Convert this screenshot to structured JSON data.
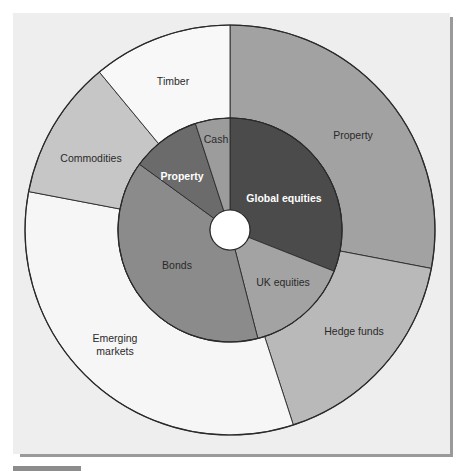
{
  "chart_data": {
    "type": "pie",
    "subtype": "donut-nested",
    "title": "",
    "center": [
      230,
      230
    ],
    "outer_ring": {
      "name": "Alternative assets",
      "slices": [
        {
          "label": "Property",
          "percent": 28,
          "color": "#a2a2a2"
        },
        {
          "label": "Hedge funds",
          "percent": 17,
          "color": "#b9b9b9"
        },
        {
          "label": "Emerging markets",
          "percent": 33,
          "color": "#f6f6f6"
        },
        {
          "label": "Commodities",
          "percent": 11,
          "color": "#c6c6c6"
        },
        {
          "label": "Timber",
          "percent": 11,
          "color": "#f8f8f8"
        }
      ]
    },
    "inner_ring": {
      "name": "Traditional assets",
      "slices": [
        {
          "label": "Global equities",
          "percent": 31,
          "color": "#4b4b4b"
        },
        {
          "label": "UK equities",
          "percent": 15,
          "color": "#a3a3a3"
        },
        {
          "label": "Bonds",
          "percent": 39,
          "color": "#8b8b8b"
        },
        {
          "label": "Property",
          "percent": 10,
          "color": "#6b6b6b"
        },
        {
          "label": "Cash",
          "percent": 5,
          "color": "#9c9c9c"
        }
      ]
    },
    "start_angle_deg": 0,
    "direction": "clockwise",
    "legend": "none (inline labels)"
  },
  "labels": {
    "outer_property": "Property",
    "hedge_funds": "Hedge funds",
    "emerging_1": "Emerging",
    "emerging_2": "markets",
    "commodities": "Commodities",
    "timber": "Timber",
    "global_equities": "Global equities",
    "uk_equities": "UK equities",
    "bonds": "Bonds",
    "inner_property": "Property",
    "cash": "Cash"
  }
}
